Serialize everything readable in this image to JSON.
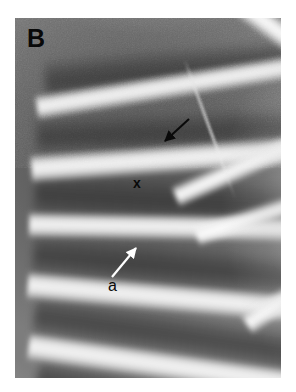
{
  "figure": {
    "panel_label": "B",
    "modality": "chest-radiograph",
    "plate": {
      "left": 15,
      "top": 18,
      "width": 266,
      "height": 360,
      "background_color": "#ffffff",
      "border_color": "#ffffff"
    },
    "tones": {
      "intercostal_dark": "#565656",
      "lung_mid": "#6e6e6e",
      "rib_bright": "#d2d2d2",
      "rib_highlight": "#f2f2f2",
      "marker_black": "#090909",
      "marker_white": "#ffffff"
    }
  },
  "annotations": [
    {
      "id": "panel-letter",
      "name": "panel-letter-b",
      "text": "B",
      "color": "#090909",
      "x": 27,
      "y": 26,
      "font_size": 25,
      "weight": "bold"
    },
    {
      "id": "arrow-upper",
      "name": "black-arrow-upper",
      "type": "arrow",
      "color": "#0a0a0a",
      "tail_x": 189,
      "tail_y": 119,
      "head_x": 163,
      "head_y": 143,
      "direction": "down-left",
      "points_at": "rib-lesion-upper"
    },
    {
      "id": "marker-x",
      "name": "x-marker",
      "text": "x",
      "color": "#090909",
      "x": 133,
      "y": 176,
      "font_size": 14,
      "weight": "bold",
      "marks": "pleural-line-midfield"
    },
    {
      "id": "arrow-lower",
      "name": "white-arrow-lower",
      "type": "arrow",
      "color": "#ffffff",
      "tail_x": 112,
      "tail_y": 278,
      "head_x": 138,
      "head_y": 246,
      "direction": "up-right",
      "points_at": "rib-lesion-lower"
    },
    {
      "id": "marker-a",
      "name": "a-marker",
      "text": "a",
      "color": "#090909",
      "x": 108,
      "y": 278,
      "font_size": 16,
      "weight": "normal",
      "labels": "white-arrow-lower"
    }
  ],
  "anatomy": {
    "ribs_visible": 7,
    "rib_orientation": "posterior ribs sweeping inferolaterally left-to-right",
    "crossing_struts": "upper-right rib/scapular crossing producing bright X",
    "intercostal_spaces": 6
  }
}
